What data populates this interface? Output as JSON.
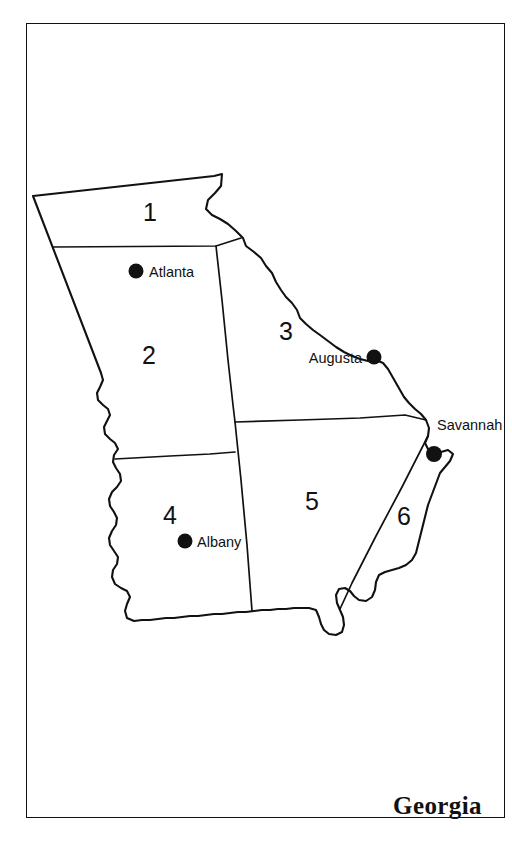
{
  "figure": {
    "title": "Georgia",
    "frame": {
      "color": "#111111"
    }
  },
  "map": {
    "state": "Georgia",
    "type": "thematic-region-map",
    "line_color": "#111111",
    "fill_color": "#ffffff",
    "regions": [
      {
        "id": "region-1",
        "label": "1",
        "x": 150,
        "y": 214
      },
      {
        "id": "region-2",
        "label": "2",
        "x": 149,
        "y": 357
      },
      {
        "id": "region-3",
        "label": "3",
        "x": 286,
        "y": 333
      },
      {
        "id": "region-4",
        "label": "4",
        "x": 170,
        "y": 517
      },
      {
        "id": "region-5",
        "label": "5",
        "x": 312,
        "y": 503
      },
      {
        "id": "region-6",
        "label": "6",
        "x": 404,
        "y": 518
      }
    ],
    "cities": [
      {
        "id": "city-atlanta",
        "label": "Atlanta",
        "dot_x": 136,
        "dot_y": 271,
        "label_x": 149,
        "label_y": 277,
        "align": "start"
      },
      {
        "id": "city-augusta",
        "label": "Augusta",
        "dot_x": 374,
        "dot_y": 357,
        "label_x": 362,
        "label_y": 363,
        "align": "end"
      },
      {
        "id": "city-savannah",
        "label": "Savannah",
        "dot_x": 434,
        "dot_y": 454,
        "label_x": 437,
        "label_y": 430,
        "align": "start"
      },
      {
        "id": "city-albany",
        "label": "Albany",
        "dot_x": 185,
        "dot_y": 541,
        "label_x": 197,
        "label_y": 547,
        "align": "start"
      }
    ]
  }
}
